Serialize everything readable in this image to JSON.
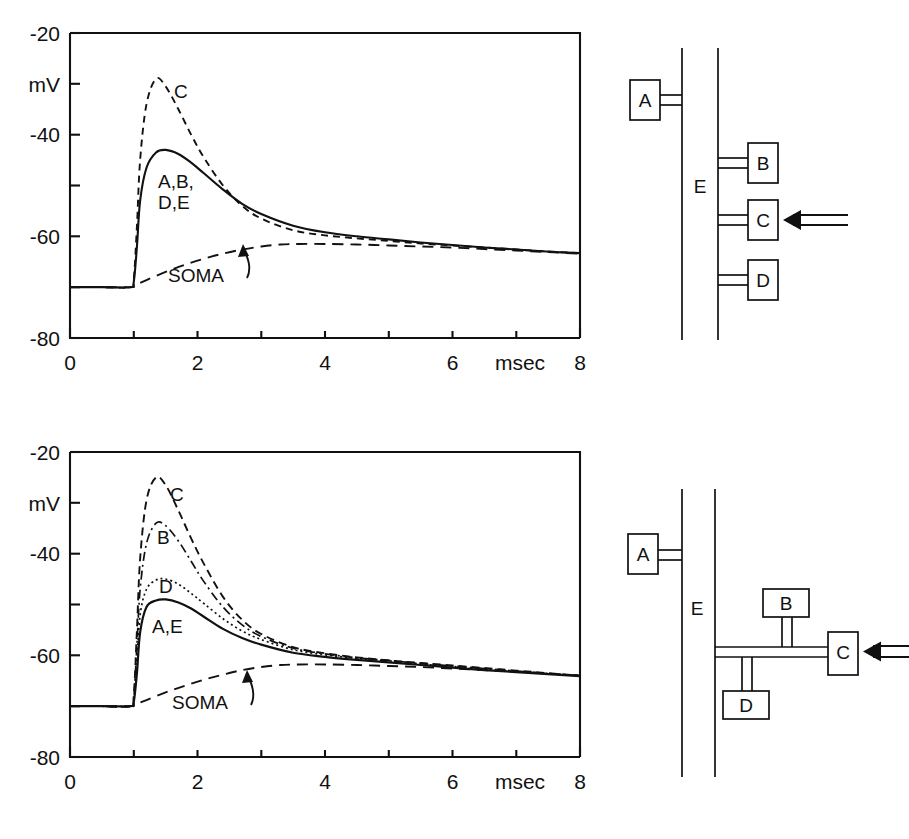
{
  "figure": {
    "panels": [
      {
        "id": "top",
        "chart": {
          "axis": {
            "ylabel": "mV",
            "xlabel": "msec",
            "yticks": [
              -20,
              -40,
              -60,
              -80
            ],
            "ytick_labels": [
              "-20",
              "-40",
              "-60",
              "-80"
            ],
            "xticks": [
              0,
              2,
              4,
              6,
              8
            ],
            "xtick_labels": [
              "0",
              "2",
              "4",
              "6",
              "8"
            ],
            "xlim": [
              0,
              8
            ],
            "ylim": [
              -80,
              -20
            ],
            "grid": false
          },
          "labels": {
            "c": "C",
            "group": "A,B,\nD,E",
            "group_line1": "A,B,",
            "group_line2": "D,E",
            "soma": "SOMA"
          }
        },
        "diagram": {
          "trunk_label": "E",
          "boxes": [
            "A",
            "B",
            "C",
            "D"
          ],
          "stimulus_target": "C"
        }
      },
      {
        "id": "bottom",
        "chart": {
          "axis": {
            "ylabel": "mV",
            "xlabel": "msec",
            "yticks": [
              -20,
              -40,
              -60,
              -80
            ],
            "ytick_labels": [
              "-20",
              "-40",
              "-60",
              "-80"
            ],
            "xticks": [
              0,
              2,
              4,
              6,
              8
            ],
            "xtick_labels": [
              "0",
              "2",
              "4",
              "6",
              "8"
            ],
            "xlim": [
              0,
              8
            ],
            "ylim": [
              -80,
              -20
            ],
            "grid": false
          },
          "labels": {
            "c": "C",
            "b": "B",
            "d": "D",
            "ae": "A,E",
            "soma": "SOMA"
          }
        },
        "diagram": {
          "trunk_label": "E",
          "boxes": [
            "A",
            "B",
            "C",
            "D"
          ],
          "stimulus_target": "C"
        }
      }
    ]
  },
  "chart_data": [
    {
      "type": "line",
      "panel": "top",
      "title": "",
      "xlabel": "msec",
      "ylabel": "mV",
      "xlim": [
        0,
        8
      ],
      "ylim": [
        -80,
        -20
      ],
      "xticks": [
        0,
        1,
        2,
        3,
        4,
        5,
        6,
        7,
        8
      ],
      "xtick_labels": [
        "0",
        "",
        "2",
        "",
        "4",
        "",
        "6",
        "",
        "8"
      ],
      "yticks": [
        -80,
        -70,
        -60,
        -50,
        -40,
        -30,
        -20
      ],
      "ytick_labels": [
        "-80",
        "",
        "-60",
        "",
        "-40",
        "",
        "-20"
      ],
      "grid": false,
      "legend": "inline-annotations",
      "baseline_mv": -70,
      "stimulus_onset_ms": 1.0,
      "series": [
        {
          "name": "C",
          "style": "dashed",
          "peak_ms": 1.35,
          "peak_mv": -29,
          "label": "C",
          "x": [
            0,
            0.5,
            0.95,
            1.0,
            1.05,
            1.1,
            1.2,
            1.35,
            1.5,
            1.7,
            1.9,
            2.1,
            2.4,
            2.7,
            3.0,
            3.5,
            4.0,
            4.5,
            5.0,
            5.5,
            6.0,
            6.5,
            7.0,
            7.5,
            8.0
          ],
          "y": [
            -70,
            -70,
            -70,
            -68.5,
            -58,
            -45,
            -34,
            -29,
            -30.5,
            -35,
            -40,
            -44.5,
            -50,
            -54,
            -56.5,
            -58.8,
            -59.8,
            -60.4,
            -60.9,
            -61.4,
            -61.8,
            -62.2,
            -62.6,
            -63.0,
            -63.3
          ]
        },
        {
          "name": "A,B,D,E",
          "style": "solid",
          "peak_ms": 1.5,
          "peak_mv": -43,
          "label": "A,B,\nD,E",
          "x": [
            0,
            0.5,
            0.95,
            1.0,
            1.05,
            1.1,
            1.2,
            1.35,
            1.5,
            1.7,
            1.9,
            2.1,
            2.4,
            2.7,
            3.0,
            3.5,
            4.0,
            4.5,
            5.0,
            5.5,
            6.0,
            6.5,
            7.0,
            7.5,
            8.0
          ],
          "y": [
            -70,
            -70,
            -70,
            -69,
            -62,
            -53,
            -46.5,
            -43.5,
            -43,
            -43.8,
            -45.5,
            -47.6,
            -50.8,
            -53.6,
            -55.6,
            -57.9,
            -59.2,
            -60.0,
            -60.6,
            -61.2,
            -61.7,
            -62.2,
            -62.6,
            -63.0,
            -63.3
          ]
        },
        {
          "name": "SOMA",
          "style": "long-dashed",
          "label": "SOMA",
          "peak_ms": 3.2,
          "peak_mv": -61.5,
          "x": [
            0,
            0.5,
            0.95,
            1.0,
            1.2,
            1.5,
            1.8,
            2.1,
            2.4,
            2.7,
            3.0,
            3.3,
            3.6,
            4.0,
            4.5,
            5.0,
            5.5,
            6.0,
            6.5,
            7.0,
            7.5,
            8.0
          ],
          "y": [
            -70,
            -70,
            -70,
            -69.8,
            -68.6,
            -67.0,
            -65.6,
            -64.4,
            -63.4,
            -62.6,
            -62.0,
            -61.6,
            -61.5,
            -61.5,
            -61.6,
            -61.8,
            -62.0,
            -62.2,
            -62.5,
            -62.8,
            -63.1,
            -63.4
          ]
        }
      ]
    },
    {
      "type": "line",
      "panel": "bottom",
      "title": "",
      "xlabel": "msec",
      "ylabel": "mV",
      "xlim": [
        0,
        8
      ],
      "ylim": [
        -80,
        -20
      ],
      "xticks": [
        0,
        1,
        2,
        3,
        4,
        5,
        6,
        7,
        8
      ],
      "xtick_labels": [
        "0",
        "",
        "2",
        "",
        "4",
        "",
        "6",
        "",
        "8"
      ],
      "yticks": [
        -80,
        -70,
        -60,
        -50,
        -40,
        -30,
        -20
      ],
      "ytick_labels": [
        "-80",
        "",
        "-60",
        "",
        "-40",
        "",
        "-20"
      ],
      "grid": false,
      "legend": "inline-annotations",
      "baseline_mv": -70,
      "stimulus_onset_ms": 1.0,
      "series": [
        {
          "name": "C",
          "style": "dashed",
          "peak_ms": 1.35,
          "peak_mv": -25,
          "label": "C",
          "x": [
            0,
            0.5,
            0.95,
            1.0,
            1.05,
            1.1,
            1.2,
            1.35,
            1.5,
            1.7,
            1.9,
            2.1,
            2.4,
            2.7,
            3.0,
            3.5,
            4.0,
            4.5,
            5.0,
            5.5,
            6.0,
            6.5,
            7.0,
            7.5,
            8.0
          ],
          "y": [
            -70,
            -70,
            -70,
            -68,
            -55,
            -41,
            -29.5,
            -25,
            -26.5,
            -31.5,
            -37,
            -42,
            -48.5,
            -53,
            -55.8,
            -58.4,
            -59.6,
            -60.4,
            -61.0,
            -61.5,
            -62.0,
            -62.5,
            -63.0,
            -63.5,
            -64.0
          ]
        },
        {
          "name": "B",
          "style": "dash-dot",
          "peak_ms": 1.4,
          "peak_mv": -34,
          "label": "B",
          "x": [
            0,
            0.5,
            0.95,
            1.0,
            1.05,
            1.1,
            1.2,
            1.35,
            1.5,
            1.7,
            1.9,
            2.1,
            2.4,
            2.7,
            3.0,
            3.5,
            4.0,
            4.5,
            5.0,
            5.5,
            6.0,
            6.5,
            7.0,
            7.5,
            8.0
          ],
          "y": [
            -70,
            -70,
            -70,
            -68.5,
            -58,
            -47,
            -38,
            -34,
            -34.5,
            -37.5,
            -41.5,
            -45.5,
            -50.5,
            -54,
            -56.3,
            -58.6,
            -59.7,
            -60.5,
            -61.0,
            -61.6,
            -62.1,
            -62.6,
            -63.1,
            -63.6,
            -64.0
          ]
        },
        {
          "name": "D",
          "style": "dotted",
          "peak_ms": 1.45,
          "peak_mv": -45,
          "label": "D",
          "x": [
            0,
            0.5,
            0.95,
            1.0,
            1.05,
            1.1,
            1.2,
            1.35,
            1.5,
            1.7,
            1.9,
            2.1,
            2.4,
            2.7,
            3.0,
            3.5,
            4.0,
            4.5,
            5.0,
            5.5,
            6.0,
            6.5,
            7.0,
            7.5,
            8.0
          ],
          "y": [
            -70,
            -70,
            -70,
            -69,
            -61,
            -52,
            -47,
            -45.2,
            -45,
            -46,
            -47.8,
            -49.8,
            -52.8,
            -55.2,
            -56.9,
            -58.9,
            -59.9,
            -60.6,
            -61.1,
            -61.7,
            -62.2,
            -62.7,
            -63.2,
            -63.6,
            -64.0
          ]
        },
        {
          "name": "A,E",
          "style": "solid",
          "peak_ms": 1.5,
          "peak_mv": -49,
          "label": "A,E",
          "x": [
            0,
            0.5,
            0.95,
            1.0,
            1.05,
            1.1,
            1.2,
            1.35,
            1.5,
            1.7,
            1.9,
            2.1,
            2.4,
            2.7,
            3.0,
            3.5,
            4.0,
            4.5,
            5.0,
            5.5,
            6.0,
            6.5,
            7.0,
            7.5,
            8.0
          ],
          "y": [
            -70,
            -70,
            -70,
            -69.2,
            -63.5,
            -55.5,
            -50.5,
            -49.2,
            -49,
            -49.6,
            -50.8,
            -52.4,
            -54.8,
            -56.6,
            -57.9,
            -59.5,
            -60.3,
            -60.9,
            -61.4,
            -61.9,
            -62.4,
            -62.9,
            -63.3,
            -63.7,
            -64.1
          ]
        },
        {
          "name": "SOMA",
          "style": "long-dashed",
          "label": "SOMA",
          "peak_ms": 3.3,
          "peak_mv": -61.8,
          "x": [
            0,
            0.5,
            0.95,
            1.0,
            1.2,
            1.5,
            1.8,
            2.1,
            2.4,
            2.7,
            3.0,
            3.3,
            3.6,
            4.0,
            4.5,
            5.0,
            5.5,
            6.0,
            6.5,
            7.0,
            7.5,
            8.0
          ],
          "y": [
            -70,
            -70,
            -70,
            -69.8,
            -68.8,
            -67.3,
            -66.0,
            -64.8,
            -63.8,
            -62.9,
            -62.3,
            -61.9,
            -61.8,
            -61.8,
            -61.9,
            -62.1,
            -62.3,
            -62.6,
            -62.9,
            -63.2,
            -63.6,
            -64.0
          ]
        }
      ]
    }
  ]
}
